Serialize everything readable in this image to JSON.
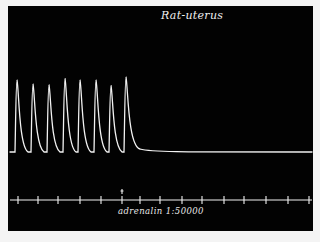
{
  "title": "Rat-uterus",
  "marker_label": "adrenalin 1:50000",
  "colors": {
    "background": "#020202",
    "trace": "#f2f2f2",
    "border": "#f4f4f4"
  },
  "chart_data": {
    "type": "line",
    "title": "Rat-uterus",
    "xlabel": "",
    "ylabel": "",
    "contraction_peaks": [
      {
        "index": 1,
        "x_px": 17,
        "relative_height": 0.92
      },
      {
        "index": 2,
        "x_px": 33,
        "relative_height": 0.87
      },
      {
        "index": 3,
        "x_px": 49,
        "relative_height": 0.86
      },
      {
        "index": 4,
        "x_px": 65,
        "relative_height": 0.94
      },
      {
        "index": 5,
        "x_px": 80,
        "relative_height": 0.92
      },
      {
        "index": 6,
        "x_px": 96,
        "relative_height": 0.92
      },
      {
        "index": 7,
        "x_px": 111,
        "relative_height": 0.85
      },
      {
        "index": 8,
        "x_px": 126,
        "relative_height": 0.96
      }
    ],
    "baseline_after": "flat, no further contractions",
    "annotations": [
      {
        "text": "adrenalin 1:50000",
        "x_px": 122,
        "type": "drug-addition marker"
      }
    ],
    "time_marks_x_px": [
      18,
      38,
      58,
      80,
      101,
      122,
      140,
      160,
      182,
      202,
      224,
      244,
      266,
      288,
      309
    ],
    "grid": false,
    "legend": null
  }
}
